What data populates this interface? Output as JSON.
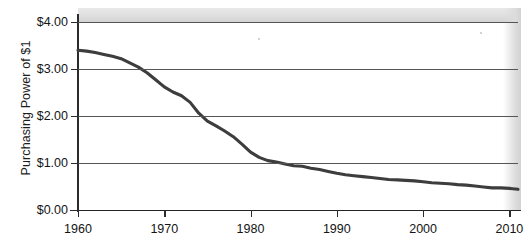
{
  "chart_data": {
    "type": "line",
    "title": "",
    "xlabel": "",
    "ylabel": "Purchasing Power of $1",
    "xlim": [
      1960,
      2011
    ],
    "ylim": [
      0,
      4
    ],
    "grid": true,
    "legend": "none",
    "y_tick_labels": [
      "$0.00",
      "$1.00",
      "$2.00",
      "$3.00",
      "$4.00"
    ],
    "y_tick_values": [
      0,
      1,
      2,
      3,
      4
    ],
    "x_tick_labels": [
      "1960",
      "1970",
      "1980",
      "1990",
      "2000",
      "2010"
    ],
    "x_tick_values": [
      1960,
      1970,
      1980,
      1990,
      2000,
      2010
    ],
    "series": [
      {
        "name": "Purchasing Power of $1",
        "color": "#3d3d3d",
        "x": [
          1960,
          1961,
          1962,
          1963,
          1964,
          1965,
          1966,
          1967,
          1968,
          1969,
          1970,
          1971,
          1972,
          1973,
          1974,
          1975,
          1976,
          1977,
          1978,
          1979,
          1980,
          1981,
          1982,
          1983,
          1984,
          1985,
          1986,
          1987,
          1988,
          1989,
          1990,
          1991,
          1992,
          1993,
          1994,
          1995,
          1996,
          1997,
          1998,
          1999,
          2000,
          2001,
          2002,
          2003,
          2004,
          2005,
          2006,
          2007,
          2008,
          2009,
          2010,
          2011
        ],
        "values": [
          3.4,
          3.38,
          3.35,
          3.31,
          3.27,
          3.22,
          3.13,
          3.04,
          2.92,
          2.77,
          2.62,
          2.51,
          2.43,
          2.29,
          2.06,
          1.89,
          1.79,
          1.68,
          1.56,
          1.4,
          1.23,
          1.12,
          1.05,
          1.02,
          0.98,
          0.94,
          0.93,
          0.89,
          0.86,
          0.82,
          0.78,
          0.75,
          0.73,
          0.71,
          0.69,
          0.67,
          0.65,
          0.64,
          0.63,
          0.62,
          0.6,
          0.58,
          0.57,
          0.56,
          0.54,
          0.53,
          0.51,
          0.49,
          0.47,
          0.47,
          0.46,
          0.44
        ]
      }
    ]
  },
  "axis": {
    "y_title": "Purchasing Power of $1"
  },
  "colors": {
    "series_line": "#3d3d3d",
    "gridline": "#555555",
    "axis": "#232323",
    "scan_band": "#dcdcdc",
    "text": "#141414"
  }
}
